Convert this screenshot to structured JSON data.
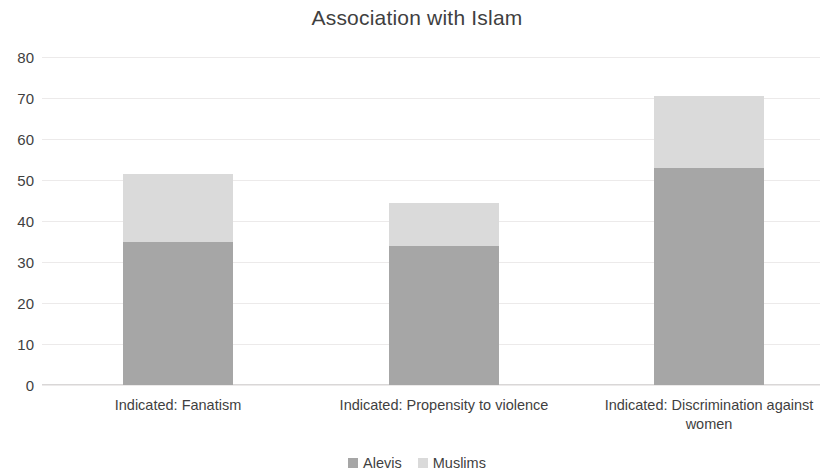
{
  "chart_data": {
    "type": "bar",
    "subtype": "stacked-column",
    "title": "Association with Islam",
    "xlabel": "",
    "ylabel": "",
    "ylim": [
      0,
      80
    ],
    "ytick_step": 10,
    "yticks": [
      80,
      70,
      60,
      50,
      40,
      30,
      20,
      10,
      0
    ],
    "grid": true,
    "legend_position": "bottom",
    "categories": [
      "Indicated: Fanatism",
      "Indicated: Propensity to violence",
      "Indicated: Discrimination against women"
    ],
    "series": [
      {
        "name": "Alevis",
        "color": "#a6a6a6",
        "values": [
          35,
          34,
          53
        ]
      },
      {
        "name": "Muslims",
        "color": "#dadada",
        "values": [
          16.5,
          10.5,
          17.5
        ]
      }
    ],
    "totals": [
      51.5,
      44.5,
      70.5
    ]
  }
}
